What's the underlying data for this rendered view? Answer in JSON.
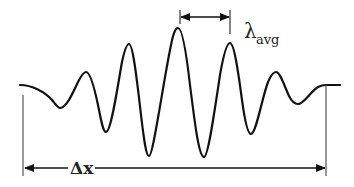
{
  "diagram": {
    "type": "wave-packet",
    "colors": {
      "stroke": "#111111",
      "guide": "#555555",
      "text": "#222222",
      "background": "#ffffff"
    },
    "labels": {
      "wavelength_symbol": "λ",
      "wavelength_subscript": "avg",
      "extent_label": "Δx"
    },
    "wave_points": {
      "start": [
        20,
        85
      ],
      "peaks": [
        [
          86,
          72
        ],
        [
          129,
          44
        ],
        [
          178,
          28
        ],
        [
          230,
          43
        ],
        [
          276,
          72
        ]
      ],
      "troughs": [
        [
          59,
          108
        ],
        [
          106,
          132
        ],
        [
          148,
          156
        ],
        [
          204,
          157
        ],
        [
          251,
          134
        ],
        [
          298,
          104
        ]
      ],
      "end": [
        340,
        85
      ]
    },
    "annotations": {
      "wavelength_arrow": {
        "x1": 180,
        "x2": 230,
        "y": 17
      },
      "extent_arrow": {
        "x1": 24,
        "x2": 326,
        "y": 168
      }
    }
  }
}
